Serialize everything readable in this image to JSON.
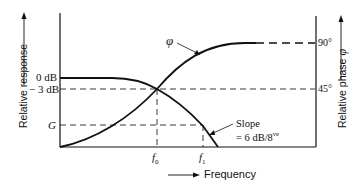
{
  "diagram": {
    "left_axis_label": "Relative response",
    "right_axis_label": "Relative phase",
    "right_axis_symbol": "φ",
    "x_axis_label": "Frequency",
    "left_ticks": {
      "zero_db": "0 dB",
      "minus3_db": "− 3 dB",
      "g": "G"
    },
    "right_ticks": {
      "ninety": "90°",
      "fortyfive": "45°"
    },
    "x_ticks": {
      "f0": "f",
      "f0_sub": "0",
      "f1": "f",
      "f1_sub": "1"
    },
    "phase_curve_label": "φ",
    "slope_label_line1": "Slope",
    "slope_label_line2": "= 6 dB/8",
    "slope_label_sup": "ve"
  }
}
